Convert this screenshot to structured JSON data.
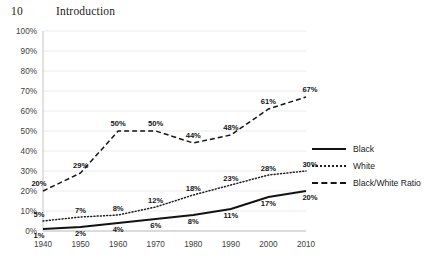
{
  "page": {
    "folio": "10",
    "running_head": "Introduction"
  },
  "chart_data": {
    "type": "line",
    "title": "",
    "subtitle": "",
    "xlabel": "",
    "ylabel": "",
    "x": [
      1940,
      1950,
      1960,
      1970,
      1980,
      1990,
      2000,
      2010
    ],
    "categories": [
      "1940",
      "1950",
      "1960",
      "1970",
      "1980",
      "1990",
      "2000",
      "2010"
    ],
    "xtick_labels": [
      "1940",
      "1950",
      "1960",
      "1970",
      "1980",
      "1990",
      "2000",
      "2010"
    ],
    "ytick_labels": [
      "0%",
      "10%",
      "20%",
      "30%",
      "40%",
      "50%",
      "60%",
      "70%",
      "80%",
      "90%",
      "100%"
    ],
    "ytick_values": [
      0,
      10,
      20,
      30,
      40,
      50,
      60,
      70,
      80,
      90,
      100
    ],
    "ylim": [
      0,
      100
    ],
    "xlim": [
      1940,
      2010
    ],
    "grid": true,
    "legend_position": "right",
    "series": [
      {
        "name": "Black",
        "style": "solid",
        "color": "#121212",
        "values": [
          1,
          2,
          4,
          6,
          8,
          11,
          17,
          20
        ],
        "labels": [
          "1%",
          "2%",
          "4%",
          "6%",
          "8%",
          "11%",
          "17%",
          "20%"
        ]
      },
      {
        "name": "White",
        "style": "dotted",
        "color": "#1d1d1d",
        "values": [
          5,
          7,
          8,
          12,
          18,
          23,
          28,
          30
        ],
        "labels": [
          "5%",
          "7%",
          "8%",
          "12%",
          "18%",
          "23%",
          "28%",
          "30%"
        ]
      },
      {
        "name": "Black/White Ratio",
        "style": "dashed",
        "color": "#151515",
        "values": [
          20,
          29,
          50,
          50,
          44,
          48,
          61,
          67
        ],
        "labels": [
          "20%",
          "29%",
          "50%",
          "50%",
          "44%",
          "48%",
          "61%",
          "67%"
        ]
      }
    ]
  },
  "legend": {
    "items": [
      {
        "label": "Black",
        "style": "solid"
      },
      {
        "label": "White",
        "style": "dotted"
      },
      {
        "label": "Black/White Ratio",
        "style": "dashed"
      }
    ]
  }
}
